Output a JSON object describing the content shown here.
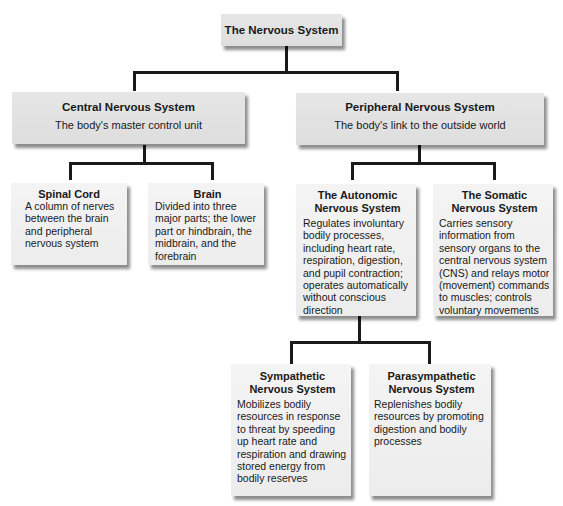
{
  "diagram": {
    "root": {
      "title": "The Nervous System"
    },
    "cns": {
      "title": "Central Nervous System",
      "subtitle": "The body's master control unit"
    },
    "pns": {
      "title": "Peripheral Nervous System",
      "subtitle": "The body's link to the outside world"
    },
    "spinal_cord": {
      "title": "Spinal Cord",
      "description": "A column of nerves between the brain and peripheral nervous system"
    },
    "brain": {
      "title": "Brain",
      "description": "Divided into three major parts; the lower part or hindbrain, the midbrain, and the forebrain"
    },
    "autonomic": {
      "title_line1": "The Autonomic",
      "title_line2": "Nervous System",
      "description": "Regulates involuntary bodily processes, including heart rate, respiration, digestion, and pupil contraction; operates automatically without conscious direction"
    },
    "somatic": {
      "title_line1": "The Somatic",
      "title_line2": "Nervous System",
      "description": "Carries sensory information from sensory organs to the central nervous system (CNS) and relays motor (movement) commands to muscles; controls voluntary movements"
    },
    "sympathetic": {
      "title_line1": "Sympathetic",
      "title_line2": "Nervous System",
      "description": "Mobilizes bodily resources in response to threat by speeding up heart rate and respiration and drawing stored energy from bodily reserves"
    },
    "parasympathetic": {
      "title_line1": "Parasympathetic",
      "title_line2": "Nervous System",
      "description": "Replenishes bodily resources by promoting digestion and bodily processes"
    }
  }
}
